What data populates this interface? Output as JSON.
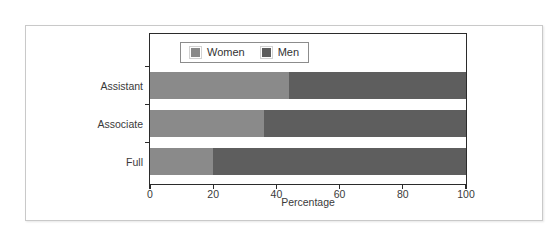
{
  "chart_data": {
    "type": "bar",
    "orientation": "horizontal",
    "stacked": true,
    "title": "",
    "xlabel": "Percentage",
    "ylabel": "",
    "categories": [
      "Assistant",
      "Associate",
      "Full"
    ],
    "series": [
      {
        "name": "Women",
        "values": [
          44,
          36,
          20
        ],
        "color": "#8a8a8a"
      },
      {
        "name": "Men",
        "values": [
          56,
          64,
          80
        ],
        "color": "#5e5e5e"
      }
    ],
    "xlim": [
      0,
      100
    ],
    "xticks": [
      0,
      20,
      40,
      60,
      80,
      100
    ],
    "xtick_labels": [
      "0",
      "20",
      "40",
      "60",
      "80",
      "100"
    ],
    "grid": false,
    "legend": {
      "position": "top-left-inside",
      "entries": [
        {
          "label": "Women",
          "color": "#8a8a8a"
        },
        {
          "label": "Men",
          "color": "#5e5e5e"
        }
      ]
    },
    "frame_color": "#2b2b2b",
    "background": "#ffffff"
  }
}
